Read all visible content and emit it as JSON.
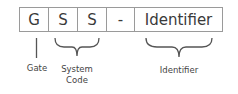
{
  "diagram": {
    "cells": [
      {
        "text": "G",
        "width": 29
      },
      {
        "text": "S",
        "width": 29
      },
      {
        "text": "S",
        "width": 29
      },
      {
        "text": "-",
        "width": 28
      },
      {
        "text": "Identifier",
        "width": 87
      }
    ],
    "labels": {
      "gate": "Gate",
      "system_line1": "System",
      "system_line2": "Code",
      "identifier": "Identifier"
    },
    "colors": {
      "border": "#9a9a9a",
      "text": "#3a3a3a",
      "annotation": "#555555"
    }
  }
}
